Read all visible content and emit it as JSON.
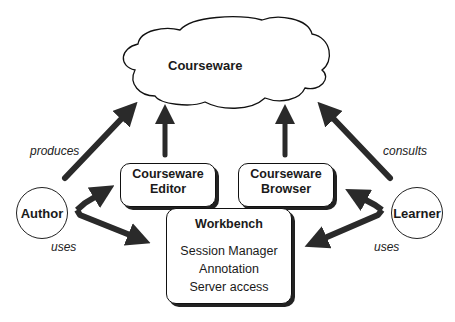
{
  "diagram": {
    "cloud": {
      "label": "Courseware"
    },
    "editor": {
      "line1": "Courseware",
      "line2": "Editor"
    },
    "browser": {
      "line1": "Courseware",
      "line2": "Browser"
    },
    "workbench": {
      "title": "Workbench",
      "items": [
        "Session Manager",
        "Annotation",
        "Server access"
      ]
    },
    "actors": {
      "author": "Author",
      "learner": "Learner"
    },
    "edge_labels": {
      "produces": "produces",
      "consults": "consults",
      "author_uses": "uses",
      "learner_uses": "uses"
    },
    "arrow_color": "#2a2a2a"
  }
}
